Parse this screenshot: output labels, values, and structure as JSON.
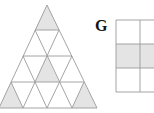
{
  "figure": {
    "label": "G",
    "colors": {
      "line": "#9a9a9a",
      "shade": "#e4e4e4",
      "background": "#ffffff"
    },
    "triangle": {
      "rows": 4,
      "shaded_cells": [
        {
          "row": 1,
          "type": "up",
          "index": 0
        },
        {
          "row": 3,
          "type": "up",
          "index": 1
        },
        {
          "row": 4,
          "type": "up",
          "index": 0
        },
        {
          "row": 4,
          "type": "up",
          "index": 3
        }
      ]
    },
    "grid": {
      "columns": 2,
      "rows": 3,
      "shaded_row": 2
    }
  }
}
